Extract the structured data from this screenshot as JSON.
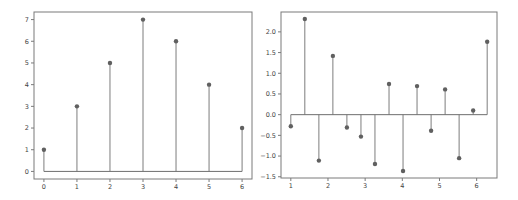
{
  "chart_data": [
    {
      "type": "stem",
      "title": "",
      "xlabel": "",
      "ylabel": "",
      "x": [
        0,
        1,
        2,
        3,
        4,
        5,
        6
      ],
      "values": [
        1,
        3,
        5,
        7,
        6,
        4,
        2
      ],
      "xticks": [
        0,
        1,
        2,
        3,
        4,
        5,
        6
      ],
      "xtick_labels": [
        "0",
        "1",
        "2",
        "3",
        "4",
        "5",
        "6"
      ],
      "yticks": [
        0,
        1,
        2,
        3,
        4,
        5,
        6,
        7
      ],
      "ytick_labels": [
        "0",
        "1",
        "2",
        "3",
        "4",
        "5",
        "6",
        "7"
      ],
      "xlim": [
        -0.3,
        6.3
      ],
      "ylim": [
        -0.35,
        7.35
      ],
      "baseline": 0,
      "grid": false,
      "legend": null,
      "colors": {
        "stem": "#7d7d7d",
        "marker": "#606060",
        "baseline": "#6e6e6e"
      }
    },
    {
      "type": "stem",
      "title": "",
      "xlabel": "",
      "ylabel": "",
      "x": [
        1.0,
        1.377,
        1.755,
        2.132,
        2.509,
        2.887,
        3.264,
        3.642,
        4.019,
        4.396,
        4.774,
        5.151,
        5.528,
        5.906,
        6.283
      ],
      "values": [
        -0.28,
        2.31,
        -1.11,
        1.42,
        -0.31,
        -0.53,
        -1.19,
        0.74,
        -1.36,
        0.69,
        -0.39,
        0.61,
        -1.05,
        0.1,
        1.76
      ],
      "xticks": [
        1,
        2,
        3,
        4,
        5,
        6
      ],
      "xtick_labels": [
        "1",
        "2",
        "3",
        "4",
        "5",
        "6"
      ],
      "yticks": [
        -1.5,
        -1.0,
        -0.5,
        0.0,
        0.5,
        1.0,
        1.5,
        2.0
      ],
      "ytick_labels": [
        "−1.5",
        "−1.0",
        "−0.5",
        "0.0",
        "0.5",
        "1.0",
        "1.5",
        "2.0"
      ],
      "xlim": [
        0.736,
        6.547
      ],
      "ylim": [
        -1.53,
        2.48
      ],
      "baseline": 0,
      "grid": false,
      "legend": null,
      "colors": {
        "stem": "#7d7d7d",
        "marker": "#606060",
        "baseline": "#6e6e6e"
      }
    }
  ],
  "layout": {
    "panels": [
      {
        "left": 34,
        "top": 12,
        "right": 252,
        "bottom": 179
      },
      {
        "left": 281,
        "top": 12,
        "right": 497,
        "bottom": 178
      }
    ]
  }
}
